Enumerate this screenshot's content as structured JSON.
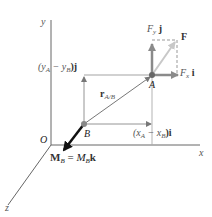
{
  "diagram": {
    "axes": {
      "x_label": "x",
      "y_label": "y",
      "z_label": "z",
      "origin_label": "O"
    },
    "points": {
      "A": "A",
      "B": "B"
    },
    "force": {
      "label": "F",
      "fy_label_main": "F",
      "fy_label_sub": "y",
      "fy_label_unit": "j",
      "fx_label_main": "F",
      "fx_label_sub": "x",
      "fx_label_unit": "i"
    },
    "position_vector": {
      "label_main": "r",
      "label_sub": "A/B"
    },
    "components": {
      "y_component": "(y_A − y_B)j",
      "y_open": "(y",
      "y_a_sub": "A",
      "y_mid": " − y",
      "y_b_sub": "B",
      "y_close": ")j",
      "x_open": "(x",
      "x_a_sub": "A",
      "x_mid": " − x",
      "x_b_sub": "B",
      "x_close": ")i"
    },
    "moment": {
      "lhs_main": "M",
      "lhs_sub": "B",
      "equals": " = ",
      "rhs_main": "M",
      "rhs_sub": "B",
      "rhs_unit": "k"
    },
    "colors": {
      "axis": "#555555",
      "force_arrow": "#8a8a8a",
      "resultant_arrow": "#bdbdbd",
      "moment_arrow": "#111111",
      "dashed": "#999999",
      "point": "#666666"
    }
  }
}
